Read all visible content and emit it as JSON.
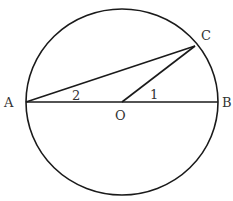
{
  "diagram": {
    "points": {
      "A": {
        "label": "A",
        "x": 26,
        "y": 102
      },
      "B": {
        "label": "B",
        "x": 218,
        "y": 102
      },
      "O": {
        "label": "O",
        "x": 122,
        "y": 102
      },
      "C": {
        "label": "C",
        "x": 195,
        "y": 46
      }
    },
    "angle_labels": {
      "angle1": "1",
      "angle2": "2"
    },
    "colors": {
      "stroke": "#1a1a1a",
      "text": "#333333",
      "background": "#ffffff"
    }
  }
}
